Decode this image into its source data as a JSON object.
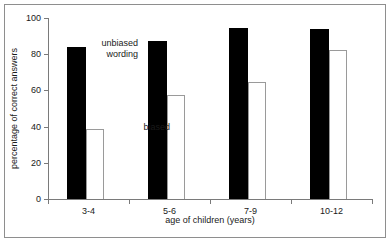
{
  "chart_data": {
    "type": "bar",
    "title": "",
    "xlabel": "age of children (years)",
    "ylabel": "percentage of correct answers",
    "categories": [
      "3-4",
      "5-6",
      "7-9",
      "10-12"
    ],
    "ylim": [
      0,
      100
    ],
    "yticks": [
      0,
      20,
      40,
      60,
      80,
      100
    ],
    "ytick_labels": [
      "0",
      "20",
      "40",
      "60",
      "80",
      "100"
    ],
    "grid": false,
    "legend_position": "in-plot annotations",
    "series": [
      {
        "name": "unbiased wording",
        "color": "#000000",
        "values": [
          84,
          87.5,
          94.5,
          94
        ]
      },
      {
        "name": "biased",
        "color": "#ffffff",
        "values": [
          38.5,
          57.5,
          64.5,
          82.5
        ]
      }
    ],
    "annotations": [
      {
        "id": "unbiased",
        "text": "unbiased\nwording"
      },
      {
        "id": "biased",
        "text": "biased"
      }
    ]
  }
}
